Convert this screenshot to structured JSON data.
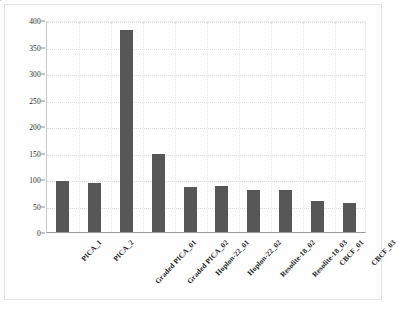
{
  "chart_data": {
    "type": "bar",
    "title": "",
    "xlabel": "",
    "ylabel": "1st Exposure Max. Bondline Temp., °C",
    "ylim": [
      0,
      400
    ],
    "yticks": [
      0,
      50,
      100,
      150,
      200,
      250,
      300,
      350,
      400
    ],
    "grid": true,
    "legend": "none",
    "categories": [
      "PICA_1",
      "PICA_2",
      "Graded PICA_01",
      "Graded PICA_02",
      "Hoplon-22_01",
      "Hoplon-22_02",
      "Resolite-18_02",
      "Resolite-18_03",
      "CBCF_01",
      "CBCF_03"
    ],
    "values": [
      97,
      92,
      381,
      147,
      85,
      87,
      79,
      79,
      58,
      55
    ],
    "bar_color": "#575757",
    "gridline_color": "#dcdcdc",
    "axis_color": "#9a9a9a"
  },
  "axis": {
    "tick_labels": [
      "400",
      "350",
      "300",
      "250",
      "200",
      "150",
      "100",
      "50",
      "0"
    ]
  },
  "artifact": {
    "bottom_text": ""
  }
}
